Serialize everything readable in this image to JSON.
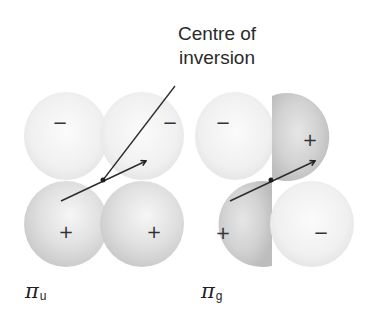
{
  "callout": {
    "line1": "Centre of",
    "line2": "inversion"
  },
  "diagrams": [
    {
      "id": "pi_u",
      "symbol": "π",
      "subscript": "u",
      "lobes": {
        "top_left": {
          "sign": "−",
          "shade": "light"
        },
        "top_right": {
          "sign": "−",
          "shade": "light"
        },
        "bottom_left": {
          "sign": "+",
          "shade": "medium"
        },
        "bottom_right": {
          "sign": "+",
          "shade": "medium"
        }
      }
    },
    {
      "id": "pi_g",
      "symbol": "π",
      "subscript": "g",
      "lobes": {
        "top_left": {
          "sign": "−",
          "shade": "light"
        },
        "top_right": {
          "sign": "+",
          "shade": "dark"
        },
        "bottom_left": {
          "sign": "+",
          "shade": "dark"
        },
        "bottom_right": {
          "sign": "−",
          "shade": "light"
        }
      }
    }
  ],
  "colors": {
    "light_lobe": "#f2f2f2",
    "medium_lobe": "#dcdcdc",
    "dark_lobe": "#cfcfcf",
    "line": "#2b2b2b",
    "background": "#ffffff"
  }
}
